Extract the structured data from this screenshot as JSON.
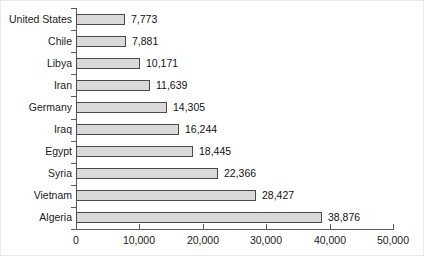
{
  "chart_data": {
    "type": "bar",
    "orientation": "horizontal",
    "title": "",
    "subtitle": "",
    "xlabel": "",
    "ylabel": "",
    "grid": false,
    "legend": false,
    "legend_position": "none",
    "xlim": [
      0,
      50000
    ],
    "x_ticks": [
      0,
      10000,
      20000,
      30000,
      40000,
      50000
    ],
    "x_tick_labels": [
      "0",
      "10,000",
      "20,000",
      "30,000",
      "40,000",
      "50,000"
    ],
    "categories": [
      "United States",
      "Chile",
      "Libya",
      "Iran",
      "Germany",
      "Iraq",
      "Egypt",
      "Syria",
      "Vietnam",
      "Algeria"
    ],
    "values": [
      7773,
      7881,
      10171,
      11639,
      14305,
      16244,
      18445,
      22366,
      28427,
      38876
    ],
    "value_labels": [
      "7,773",
      "7,881",
      "10,171",
      "11,639",
      "14,305",
      "16,244",
      "18,445",
      "22,366",
      "28,427",
      "38,876"
    ],
    "colors": {
      "bar_fill": "#d9d9d9",
      "bar_border": "#4a4a4a",
      "axis": "#5a5a5a",
      "text": "#1a1a1a",
      "background": "#ffffff"
    }
  }
}
